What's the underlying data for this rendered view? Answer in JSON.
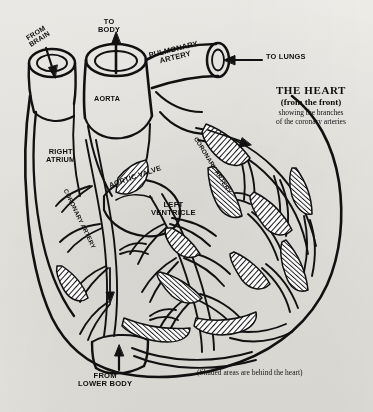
{
  "figure": {
    "title": {
      "line1": "THE HEART",
      "line2": "(from the front)",
      "line3": "showing the branches",
      "line4": "of the coronary arteries"
    },
    "footnote": "(Shaded areas are behind the heart)",
    "labels": [
      {
        "id": "from-brain",
        "text": "FROM\nBRAIN",
        "x": 24,
        "y": 36,
        "size": 7.0,
        "rotate": -32
      },
      {
        "id": "to-body",
        "text": "TO\nBODY",
        "x": 98,
        "y": 22,
        "size": 7.4,
        "rotate": 0
      },
      {
        "id": "pulmonary-artery",
        "text": "PULMONARY\nARTERY",
        "x": 148,
        "y": 54,
        "size": 7.6,
        "rotate": -14
      },
      {
        "id": "to-lungs",
        "text": "TO LUNGS",
        "x": 238,
        "y": 52,
        "size": 7.4,
        "rotate": 0
      },
      {
        "id": "aorta",
        "text": "AORTA",
        "x": 91,
        "y": 97,
        "size": 7.2,
        "rotate": 0
      },
      {
        "id": "right-atrium",
        "text": "RIGHT\nATRIUM",
        "x": 46,
        "y": 150,
        "size": 7.4,
        "rotate": 0
      },
      {
        "id": "coronary-artery-left",
        "text": "CORONARY  ARTERY",
        "x": 60,
        "y": 190,
        "size": 6.2,
        "rotate": 64
      },
      {
        "id": "aortic-valve",
        "text": "AORTIC VALVE",
        "x": 110,
        "y": 170,
        "size": 7.2,
        "rotate": -20
      },
      {
        "id": "coronary-artery-right",
        "text": "CORONARY  ARTERY",
        "x": 196,
        "y": 140,
        "size": 6.2,
        "rotate": 58
      },
      {
        "id": "left-ventricle",
        "text": "LEFT\nVENTRICLE",
        "x": 151,
        "y": 203,
        "size": 7.6,
        "rotate": 0
      },
      {
        "id": "from-lower-body",
        "text": "FROM\nLOWER BODY",
        "x": 78,
        "y": 376,
        "size": 7.6,
        "rotate": 0
      }
    ],
    "colors": {
      "paper": "#f4f3f1",
      "ink": "#111111",
      "shading": "#6b6b6b"
    },
    "icons": {
      "arrow_to_body": "up-arrow-icon",
      "arrow_from_brain": "down-arrow-icon",
      "arrow_to_lungs": "left-arrow-icon",
      "arrow_from_lower_body": "up-arrow-icon",
      "arrow_coronary_flow": "down-arrow-icon"
    }
  }
}
